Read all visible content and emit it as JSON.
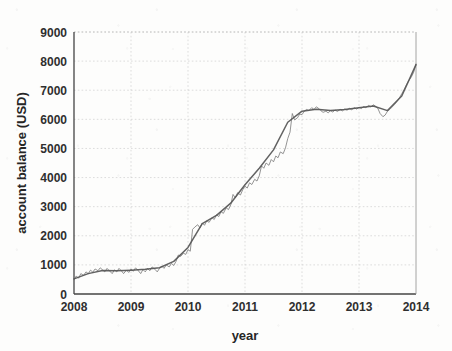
{
  "chart_data": {
    "type": "line",
    "title": "",
    "xlabel": "year",
    "ylabel": "account balance (USD)",
    "xlim": [
      2008,
      2014
    ],
    "ylim": [
      0,
      9000
    ],
    "grid": true,
    "legend": "none",
    "xticks": [
      "2008",
      "2009",
      "2010",
      "2011",
      "2012",
      "2013",
      "2014"
    ],
    "xtick_values": [
      2008,
      2009,
      2010,
      2011,
      2012,
      2013,
      2014
    ],
    "yticks": [
      "0",
      "1000",
      "2000",
      "3000",
      "4000",
      "5000",
      "6000",
      "7000",
      "8000",
      "9000"
    ],
    "ytick_values": [
      0,
      1000,
      2000,
      3000,
      4000,
      5000,
      6000,
      7000,
      8000,
      9000
    ],
    "series": [
      {
        "name": "account balance (noisy)",
        "color": "#7a7a7a",
        "x": [
          2008.0,
          2008.04,
          2008.08,
          2008.12,
          2008.17,
          2008.21,
          2008.25,
          2008.29,
          2008.33,
          2008.37,
          2008.42,
          2008.46,
          2008.5,
          2008.54,
          2008.58,
          2008.62,
          2008.67,
          2008.71,
          2008.75,
          2008.79,
          2008.83,
          2008.87,
          2008.92,
          2008.96,
          2009.0,
          2009.04,
          2009.08,
          2009.12,
          2009.17,
          2009.21,
          2009.25,
          2009.29,
          2009.33,
          2009.37,
          2009.42,
          2009.46,
          2009.5,
          2009.54,
          2009.58,
          2009.62,
          2009.67,
          2009.71,
          2009.75,
          2009.79,
          2009.83,
          2009.87,
          2009.92,
          2009.96,
          2010.0,
          2010.04,
          2010.08,
          2010.12,
          2010.17,
          2010.21,
          2010.25,
          2010.29,
          2010.33,
          2010.37,
          2010.42,
          2010.46,
          2010.5,
          2010.54,
          2010.58,
          2010.62,
          2010.67,
          2010.71,
          2010.75,
          2010.79,
          2010.83,
          2010.87,
          2010.92,
          2010.96,
          2011.0,
          2011.04,
          2011.08,
          2011.12,
          2011.17,
          2011.21,
          2011.25,
          2011.29,
          2011.33,
          2011.37,
          2011.42,
          2011.46,
          2011.5,
          2011.54,
          2011.58,
          2011.62,
          2011.67,
          2011.71,
          2011.75,
          2011.79,
          2011.83,
          2011.87,
          2011.92,
          2011.96,
          2012.0,
          2012.04,
          2012.08,
          2012.12,
          2012.17,
          2012.21,
          2012.25,
          2012.29,
          2012.33,
          2012.37,
          2012.42,
          2012.46,
          2012.5,
          2012.54,
          2012.58,
          2012.62,
          2012.67,
          2012.71,
          2012.75,
          2012.79,
          2012.83,
          2012.87,
          2012.92,
          2012.96,
          2013.0,
          2013.04,
          2013.08,
          2013.12,
          2013.17,
          2013.21,
          2013.25,
          2013.29,
          2013.33,
          2013.37,
          2013.42,
          2013.46,
          2013.5,
          2013.54,
          2013.58,
          2013.62,
          2013.67,
          2013.71,
          2013.75,
          2013.79,
          2013.83,
          2013.87,
          2013.92,
          2013.96,
          2014.0
        ],
        "y": [
          480,
          620,
          540,
          700,
          640,
          760,
          700,
          820,
          750,
          860,
          800,
          900,
          830,
          760,
          880,
          800,
          700,
          830,
          760,
          880,
          800,
          700,
          820,
          740,
          860,
          780,
          900,
          820,
          700,
          840,
          760,
          880,
          800,
          930,
          850,
          760,
          880,
          960,
          880,
          1000,
          930,
          1050,
          980,
          1120,
          1340,
          1290,
          1400,
          1360,
          1520,
          1470,
          2220,
          2300,
          2380,
          2270,
          2440,
          2360,
          2520,
          2460,
          2620,
          2560,
          2720,
          2660,
          2830,
          2770,
          2960,
          2900,
          3060,
          3420,
          3300,
          3480,
          3400,
          3580,
          3700,
          3640,
          3820,
          3760,
          3940,
          3880,
          4060,
          4400,
          4320,
          4500,
          4420,
          4620,
          4540,
          4740,
          4680,
          4880,
          4820,
          5020,
          5340,
          5560,
          6200,
          5980,
          6050,
          6180,
          6160,
          6280,
          6340,
          6300,
          6400,
          6340,
          6430,
          6380,
          6300,
          6240,
          6280,
          6220,
          6300,
          6250,
          6320,
          6270,
          6340,
          6290,
          6360,
          6310,
          6380,
          6330,
          6400,
          6350,
          6420,
          6370,
          6440,
          6400,
          6480,
          6420,
          6500,
          6450,
          6380,
          6200,
          6090,
          6150,
          6280,
          6340,
          6420,
          6500,
          6620,
          6740,
          6880,
          7020,
          7180,
          7320,
          7460,
          7620,
          7900
        ]
      },
      {
        "name": "smoothed trend",
        "color": "#555555",
        "x": [
          2008.0,
          2008.25,
          2008.5,
          2008.75,
          2009.0,
          2009.25,
          2009.5,
          2009.75,
          2010.0,
          2010.25,
          2010.5,
          2010.75,
          2011.0,
          2011.25,
          2011.5,
          2011.75,
          2012.0,
          2012.25,
          2012.5,
          2012.75,
          2013.0,
          2013.25,
          2013.5,
          2013.75,
          2014.0
        ],
        "y": [
          520,
          700,
          810,
          800,
          820,
          850,
          900,
          1120,
          1600,
          2420,
          2700,
          3120,
          3750,
          4320,
          4950,
          5900,
          6280,
          6350,
          6300,
          6340,
          6400,
          6460,
          6300,
          6800,
          7880
        ]
      }
    ]
  },
  "axes": {
    "ylabel": "account balance (USD)",
    "xlabel": "year"
  }
}
